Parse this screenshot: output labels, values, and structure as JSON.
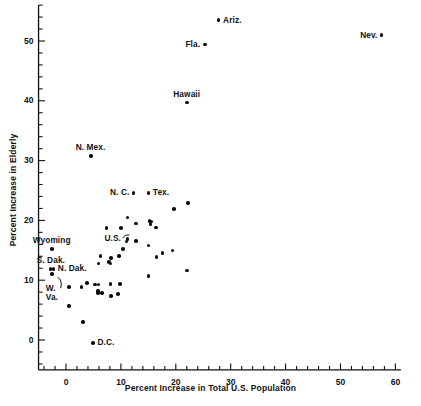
{
  "chart_data": {
    "type": "scatter",
    "title": "",
    "xlabel": "Percent Increase in Total U.S. Population",
    "ylabel": "Percent Increase in Elderly",
    "xlim": [
      -5,
      61
    ],
    "ylim": [
      -5,
      56
    ],
    "xticks": [
      0,
      10,
      20,
      30,
      40,
      50,
      60
    ],
    "xtick_labels": [
      "0",
      "10",
      "20",
      "30",
      "40",
      "50",
      "60"
    ],
    "yticks": [
      0,
      10,
      20,
      30,
      40,
      50
    ],
    "ytick_labels": [
      "0",
      "10",
      "20",
      "30",
      "40",
      "50"
    ],
    "x_minor_tick_step": 2,
    "y_minor_tick_step": 2,
    "grid": false,
    "legend": false,
    "marker": "filled-circle",
    "marker_color": "#0d0d0d",
    "points": [
      {
        "x": 27.8,
        "y": 53.5,
        "label": "Ariz.",
        "label_pos": "right"
      },
      {
        "x": 57.5,
        "y": 51.0,
        "label": "Nev.",
        "label_pos": "left"
      },
      {
        "x": 25.3,
        "y": 49.4,
        "label": "Fla.",
        "label_pos": "left"
      },
      {
        "x": 22.0,
        "y": 39.7,
        "label": "Hawaii",
        "label_pos": "above"
      },
      {
        "x": 4.5,
        "y": 30.8,
        "label": "N. Mex.",
        "label_pos": "above"
      },
      {
        "x": 12.3,
        "y": 24.6,
        "label": "N. C.",
        "label_pos": "left"
      },
      {
        "x": 15.0,
        "y": 24.6,
        "label": "Tex.",
        "label_pos": "right"
      },
      {
        "x": 22.2,
        "y": 22.9,
        "label": "",
        "label_pos": ""
      },
      {
        "x": 19.7,
        "y": 21.9,
        "label": "",
        "label_pos": ""
      },
      {
        "x": 11.2,
        "y": 20.5,
        "label": "",
        "label_pos": ""
      },
      {
        "x": 15.2,
        "y": 19.9,
        "label": "",
        "label_pos": ""
      },
      {
        "x": 15.6,
        "y": 19.8,
        "label": "",
        "label_pos": ""
      },
      {
        "x": 15.4,
        "y": 19.4,
        "label": "",
        "label_pos": ""
      },
      {
        "x": 12.8,
        "y": 19.5,
        "label": "",
        "label_pos": ""
      },
      {
        "x": 16.4,
        "y": 18.8,
        "label": "",
        "label_pos": ""
      },
      {
        "x": 7.4,
        "y": 18.7,
        "label": "",
        "label_pos": ""
      },
      {
        "x": 10.0,
        "y": 18.7,
        "label": "",
        "label_pos": ""
      },
      {
        "x": 11.2,
        "y": 16.9,
        "label": "U.S.",
        "label_pos": "leader-left"
      },
      {
        "x": 11.0,
        "y": 16.5,
        "label": "",
        "label_pos": ""
      },
      {
        "x": 12.7,
        "y": 16.6,
        "label": "",
        "label_pos": ""
      },
      {
        "x": 15.0,
        "y": 15.8,
        "label": "",
        "label_pos": ""
      },
      {
        "x": 10.4,
        "y": 15.2,
        "label": "",
        "label_pos": ""
      },
      {
        "x": 19.4,
        "y": 15.0,
        "label": "",
        "label_pos": ""
      },
      {
        "x": 17.6,
        "y": 14.5,
        "label": "",
        "label_pos": ""
      },
      {
        "x": 16.5,
        "y": 13.9,
        "label": "",
        "label_pos": ""
      },
      {
        "x": 6.3,
        "y": 14.0,
        "label": "",
        "label_pos": ""
      },
      {
        "x": 9.7,
        "y": 14.0,
        "label": "",
        "label_pos": ""
      },
      {
        "x": 8.2,
        "y": 13.7,
        "label": "",
        "label_pos": ""
      },
      {
        "x": 7.8,
        "y": 13.0,
        "label": "",
        "label_pos": ""
      },
      {
        "x": 8.1,
        "y": 12.8,
        "label": "",
        "label_pos": ""
      },
      {
        "x": 5.9,
        "y": 12.8,
        "label": "",
        "label_pos": ""
      },
      {
        "x": 22.0,
        "y": 11.6,
        "label": "",
        "label_pos": ""
      },
      {
        "x": 15.0,
        "y": 10.7,
        "label": "",
        "label_pos": ""
      },
      {
        "x": -2.6,
        "y": 15.2,
        "label": "Wyoming",
        "label_pos": "above"
      },
      {
        "x": -2.8,
        "y": 11.9,
        "label": "S. Dak.",
        "label_pos": "above"
      },
      {
        "x": -2.3,
        "y": 11.9,
        "label": "N. Dak.",
        "label_pos": "right"
      },
      {
        "x": -2.6,
        "y": 11.0,
        "label": "W. Va.",
        "label_pos": "leader-below"
      },
      {
        "x": 0.5,
        "y": 8.9,
        "label": "",
        "label_pos": ""
      },
      {
        "x": 2.8,
        "y": 8.9,
        "label": "",
        "label_pos": ""
      },
      {
        "x": 3.8,
        "y": 9.5,
        "label": "",
        "label_pos": ""
      },
      {
        "x": 5.3,
        "y": 9.3,
        "label": "",
        "label_pos": ""
      },
      {
        "x": 5.9,
        "y": 9.3,
        "label": "",
        "label_pos": ""
      },
      {
        "x": 8.1,
        "y": 9.4,
        "label": "",
        "label_pos": ""
      },
      {
        "x": 9.8,
        "y": 9.4,
        "label": "",
        "label_pos": ""
      },
      {
        "x": 5.8,
        "y": 8.2,
        "label": "",
        "label_pos": ""
      },
      {
        "x": 5.8,
        "y": 7.9,
        "label": "",
        "label_pos": ""
      },
      {
        "x": 6.6,
        "y": 7.9,
        "label": "",
        "label_pos": ""
      },
      {
        "x": 8.2,
        "y": 7.4,
        "label": "",
        "label_pos": ""
      },
      {
        "x": 9.5,
        "y": 7.7,
        "label": "",
        "label_pos": ""
      },
      {
        "x": 0.6,
        "y": 5.7,
        "label": "",
        "label_pos": ""
      },
      {
        "x": 3.1,
        "y": 3.0,
        "label": "",
        "label_pos": ""
      },
      {
        "x": 4.9,
        "y": -0.5,
        "label": "D.C.",
        "label_pos": "right"
      }
    ]
  }
}
